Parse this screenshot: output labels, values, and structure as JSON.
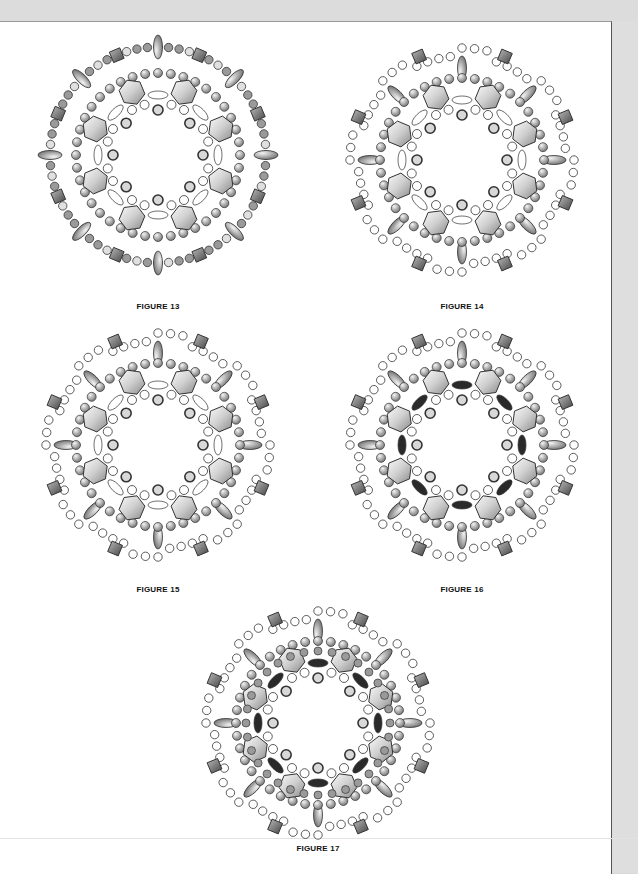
{
  "document": {
    "type": "beading pattern page",
    "figures": [
      {
        "id": "fig13",
        "caption": "FIGURE 13",
        "style": "full-gray"
      },
      {
        "id": "fig14",
        "caption": "FIGURE 14",
        "style": "open-outer"
      },
      {
        "id": "fig15",
        "caption": "FIGURE 15",
        "style": "open-outer-bold"
      },
      {
        "id": "fig16",
        "caption": "FIGURE 16",
        "style": "dark-accent"
      },
      {
        "id": "fig17",
        "caption": "FIGURE 17",
        "style": "dense"
      }
    ]
  },
  "colors": {
    "page": "#ffffff",
    "margin": "#dcdcdc",
    "bead_gray": "#9a9a9a",
    "bead_light": "#d8d8d8",
    "bead_dark": "#2a2a2a",
    "outline": "#333333"
  }
}
